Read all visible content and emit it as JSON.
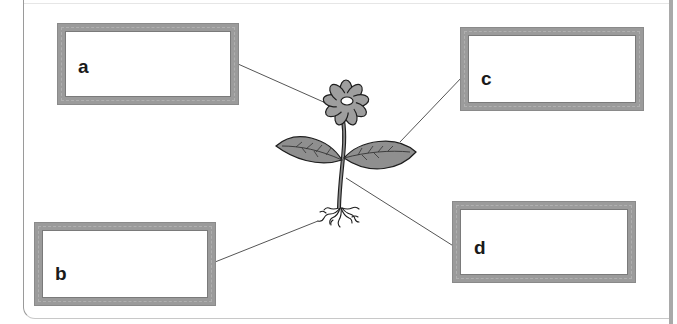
{
  "diagram": {
    "labels": [
      {
        "id": "a",
        "text": "a",
        "points_to": "flower"
      },
      {
        "id": "b",
        "text": "b",
        "points_to": "roots"
      },
      {
        "id": "c",
        "text": "c",
        "points_to": "leaf"
      },
      {
        "id": "d",
        "text": "d",
        "points_to": "stem"
      }
    ],
    "answer_boxes": {
      "a": "",
      "b": "",
      "c": "",
      "d": ""
    },
    "icons": {
      "plant": "plant-illustration",
      "flower": "flower-icon",
      "leaf": "leaf-icon",
      "stem": "stem-icon",
      "roots": "roots-icon"
    },
    "colors": {
      "box_border": "#9b9b9b",
      "petal_fill": "#9e9e9e",
      "leaf_fill": "#8f8f8f",
      "line": "#555555",
      "outline": "#1e1e1e"
    }
  }
}
